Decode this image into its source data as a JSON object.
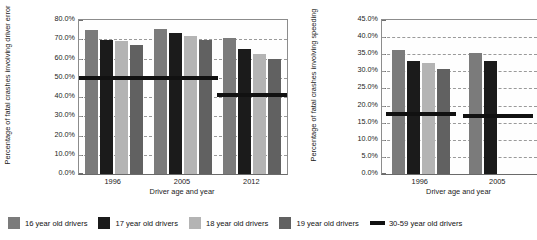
{
  "figure": {
    "legend": {
      "items": [
        {
          "label": "16 year old drivers",
          "marker": "square-swatch",
          "color": "#7b7b7b"
        },
        {
          "label": "17 year old drivers",
          "marker": "square-swatch",
          "color": "#1b1b1b"
        },
        {
          "label": "18 year old drivers",
          "marker": "square-swatch",
          "color": "#b4b4b4"
        },
        {
          "label": "19 year old drivers",
          "marker": "square-swatch",
          "color": "#616161"
        },
        {
          "label": "30-59 year old drivers",
          "marker": "line-swatch",
          "color": "#111111"
        }
      ]
    }
  },
  "chart_data": [
    {
      "id": "driver-error",
      "type": "bar",
      "title": "",
      "xlabel": "Driver age and year",
      "ylabel": "Percentage of fatal crashes involving driver error",
      "categories": [
        "1996",
        "2005",
        "2012"
      ],
      "ylim": [
        0,
        80
      ],
      "ytick_labels": [
        "0.0%",
        "10.0%",
        "20.0%",
        "30.0%",
        "40.0%",
        "50.0%",
        "60.0%",
        "70.0%",
        "80.0%"
      ],
      "ytick_values": [
        0,
        10,
        20,
        30,
        40,
        50,
        60,
        70,
        80
      ],
      "grid": "horizontal-dashed",
      "legend_position": "below-figure",
      "series": [
        {
          "name": "16 year old drivers",
          "color": "#7b7b7b",
          "values": [
            75.0,
            75.3,
            70.8
          ]
        },
        {
          "name": "17 year old drivers",
          "color": "#1b1b1b",
          "values": [
            69.5,
            73.5,
            64.9
          ]
        },
        {
          "name": "18 year old drivers",
          "color": "#b4b4b4",
          "values": [
            69.3,
            71.5,
            62.6
          ]
        },
        {
          "name": "19 year old drivers",
          "color": "#616161",
          "values": [
            67.0,
            69.8,
            59.6
          ]
        }
      ],
      "reference_series": {
        "name": "30-59 year old drivers",
        "type": "line",
        "color": "#111111",
        "values": [
          50.0,
          49.8,
          41.0
        ]
      }
    },
    {
      "id": "speeding",
      "type": "bar",
      "title": "",
      "xlabel": "Driver age and year",
      "ylabel": "Percentage of fatal crashes involving speeding",
      "categories": [
        "1996",
        "2005"
      ],
      "ylim": [
        0,
        45
      ],
      "ytick_labels": [
        "0.0%",
        "5.0%",
        "10.0%",
        "15.0%",
        "20.0%",
        "25.0%",
        "30.0%",
        "35.0%",
        "40.0%",
        "45.0%"
      ],
      "ytick_values": [
        0,
        5,
        10,
        15,
        20,
        25,
        30,
        35,
        40,
        45
      ],
      "grid": "horizontal-dashed",
      "legend_position": "below-figure",
      "note": "panel cropped at right edge of screenshot",
      "series": [
        {
          "name": "16 year old drivers",
          "color": "#7b7b7b",
          "values": [
            36.2,
            35.3
          ]
        },
        {
          "name": "17 year old drivers",
          "color": "#1b1b1b",
          "values": [
            33.0,
            33.0
          ]
        },
        {
          "name": "18 year old drivers",
          "color": "#b4b4b4",
          "values": [
            32.3,
            null
          ]
        },
        {
          "name": "19 year old drivers",
          "color": "#616161",
          "values": [
            30.8,
            null
          ]
        }
      ],
      "reference_series": {
        "name": "30-59 year old drivers",
        "type": "line",
        "color": "#111111",
        "values": [
          17.5,
          17.0
        ]
      }
    }
  ]
}
